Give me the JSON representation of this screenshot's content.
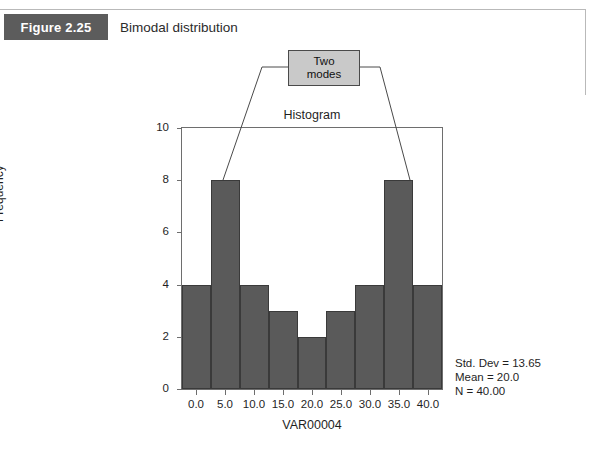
{
  "figure": {
    "badge_label": "Figure 2.25",
    "caption": "Bimodal distribution"
  },
  "callout": {
    "line1": "Two",
    "line2": "modes"
  },
  "stats": {
    "std_dev": "Std. Dev = 13.65",
    "mean": "Mean = 20.0",
    "n": "N = 40.00"
  },
  "colors": {
    "badge_bg": "#5c5c5c",
    "bar_fill": "#5a5a5a",
    "bar_stroke": "#3a3a3a",
    "callout_bg": "#c9c9c9",
    "axis": "#6e6e6e"
  },
  "chart_data": {
    "type": "bar",
    "title": "Histogram",
    "xlabel": "VAR00004",
    "ylabel": "Frequency",
    "categories": [
      "0.0",
      "5.0",
      "10.0",
      "15.0",
      "20.0",
      "25.0",
      "30.0",
      "35.0",
      "40.0"
    ],
    "values": [
      4,
      8,
      4,
      3,
      2,
      3,
      4,
      8,
      4
    ],
    "x_tick_labels": [
      "0.0",
      "5.0",
      "10.0",
      "15.0",
      "20.0",
      "25.0",
      "30.0",
      "35.0",
      "40.0"
    ],
    "y_tick_labels": [
      "0",
      "2",
      "4",
      "6",
      "8",
      "10"
    ],
    "y_ticks": [
      0,
      2,
      4,
      6,
      8,
      10
    ],
    "ylim": [
      0,
      10
    ],
    "grid": false,
    "legend": "none",
    "annotations": [
      {
        "text": "Two modes",
        "points_to": [
          "5.0",
          "35.0"
        ]
      }
    ]
  }
}
